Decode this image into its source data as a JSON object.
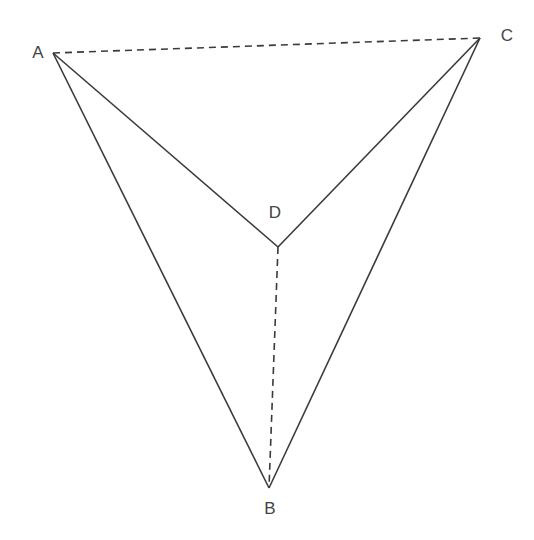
{
  "diagram": {
    "type": "tetrahedron-net-projection",
    "stroke_color": "#3a3a3a",
    "points": {
      "A": {
        "label": "A",
        "x": 53,
        "y": 53,
        "label_x": 38,
        "label_y": 58
      },
      "B": {
        "label": "B",
        "x": 269,
        "y": 488,
        "label_x": 270,
        "label_y": 514
      },
      "C": {
        "label": "C",
        "x": 480,
        "y": 38,
        "label_x": 507,
        "label_y": 41
      },
      "D": {
        "label": "D",
        "x": 278,
        "y": 247,
        "label_x": 275,
        "label_y": 218
      }
    },
    "solid_edges": [
      [
        "A",
        "B"
      ],
      [
        "A",
        "D"
      ],
      [
        "C",
        "D"
      ],
      [
        "C",
        "B"
      ]
    ],
    "dashed_edges": [
      [
        "A",
        "C"
      ],
      [
        "D",
        "B"
      ]
    ]
  }
}
